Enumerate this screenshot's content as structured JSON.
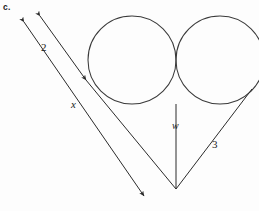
{
  "figure": {
    "part_label": "c.",
    "stroke_color": "#2b2b2b",
    "background_color": "#fdfdfd",
    "labels": {
      "side_two": "2",
      "side_x": "x",
      "height_w": "w",
      "side_three": "3"
    },
    "geometry": {
      "left_circle": {
        "cx": 132,
        "cy": 60,
        "r": 44
      },
      "right_circle": {
        "cx": 220,
        "cy": 60,
        "r": 44
      },
      "apex": {
        "x": 176,
        "y": 189
      },
      "left_line": {
        "x1": 20,
        "y1": 17,
        "x2": 148,
        "y2": 201
      },
      "right_line": {
        "x1": 36,
        "y1": 11,
        "x2": 176,
        "y2": 189
      },
      "w_line": {
        "x1": 176,
        "y1": 104,
        "x2": 176,
        "y2": 189
      },
      "three_line": {
        "x1": 176,
        "y1": 189,
        "x2": 252,
        "y2": 89
      }
    },
    "arrowheads": [
      {
        "name": "upper-left-arrow-on-x",
        "x": 20,
        "y": 17
      },
      {
        "name": "upper-left-arrow-on-2",
        "x": 36,
        "y": 11
      },
      {
        "name": "mid-arrow-on-2",
        "x": 88,
        "y": 82
      },
      {
        "name": "lower-right-arrow-on-x",
        "x": 148,
        "y": 201
      }
    ]
  }
}
